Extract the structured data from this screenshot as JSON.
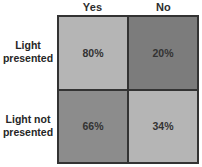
{
  "chart_data": {
    "type": "heatmap",
    "title": "",
    "columns": [
      "Yes",
      "No"
    ],
    "rows": [
      "Light presented",
      "Light not presented"
    ],
    "values": [
      [
        80,
        20
      ],
      [
        66,
        34
      ]
    ],
    "value_labels": [
      [
        "80%",
        "20%"
      ],
      [
        "66%",
        "34%"
      ]
    ],
    "cell_colors": [
      [
        "#b5b5b5",
        "#7c7c7c"
      ],
      [
        "#8c8c8c",
        "#b5b5b5"
      ]
    ],
    "grid_border_color": "#333333",
    "legend": "none"
  },
  "ui": {
    "row_labels": [
      {
        "line1": "Light",
        "line2": "presented"
      },
      {
        "line1": "Light not",
        "line2": "presented"
      }
    ]
  }
}
